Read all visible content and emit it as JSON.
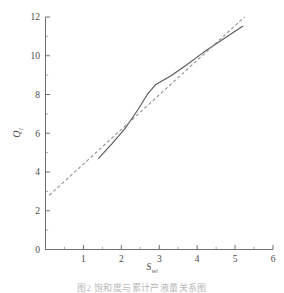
{
  "figure": {
    "caption": "图2  饱和度与累计产液量关系图"
  },
  "chart_data": {
    "type": "line",
    "title": "",
    "xlabel": "S",
    "xlabel_sub": "wi",
    "ylabel": "Q",
    "ylabel_sub": "l",
    "xlim": [
      0,
      6
    ],
    "ylim": [
      0,
      12
    ],
    "x_major_ticks": [
      0,
      1,
      2,
      3,
      4,
      5,
      6
    ],
    "x_tick_labels": [
      "",
      "1",
      "2",
      "3",
      "4",
      "5",
      "6"
    ],
    "x_minor_step": 0.5,
    "y_major_ticks": [
      0,
      2,
      4,
      6,
      8,
      10,
      12
    ],
    "y_tick_labels": [
      "0",
      "2",
      "4",
      "6",
      "8",
      "10",
      "12"
    ],
    "y_minor_step": 1,
    "grid": false,
    "legend": false,
    "frame": "left-bottom",
    "tick_direction": "in",
    "series": [
      {
        "name": "measured-curve",
        "style": "solid",
        "color": "#5a5a5a",
        "points": [
          [
            1.4,
            4.7
          ],
          [
            1.75,
            5.45
          ],
          [
            2.1,
            6.25
          ],
          [
            2.45,
            7.25
          ],
          [
            2.7,
            8.05
          ],
          [
            2.9,
            8.5
          ],
          [
            3.3,
            8.95
          ],
          [
            3.7,
            9.5
          ],
          [
            4.15,
            10.15
          ],
          [
            4.6,
            10.75
          ],
          [
            5.2,
            11.52
          ]
        ]
      },
      {
        "name": "trend-line",
        "style": "dashed",
        "color": "#8d8d8d",
        "points": [
          [
            0.1,
            2.8
          ],
          [
            5.25,
            12.0
          ]
        ]
      }
    ]
  }
}
